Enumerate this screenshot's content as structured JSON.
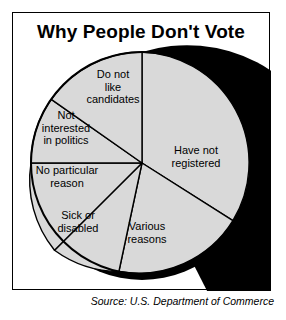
{
  "chart_title": "Why People Don't Vote",
  "source_note": "Source: U.S. Department of Commerce",
  "colors": {
    "slice_fill": "#d9d9d9",
    "outline": "#000000",
    "shadow": "#000000",
    "background": "#ffffff",
    "text": "#000000"
  },
  "labels": {
    "have_not_registered": "Have not\nregistered",
    "various_reasons": "Various\nreasons",
    "sick_or_disabled": "Sick or\ndisabled",
    "no_particular_reason": "No particular\nreason",
    "not_interested_in_politics": "Not\ninterested\nin politics",
    "do_not_like_candidates": "Do not\nlike\ncandidates"
  },
  "chart_data": {
    "type": "pie",
    "title": "Why People Don't Vote",
    "xlabel": "",
    "ylabel": "",
    "legend_position": "none",
    "grid": false,
    "labels_inside_slices": true,
    "start_angle_deg": 0,
    "direction": "clockwise",
    "categories": [
      "Have not registered",
      "Various reasons",
      "Sick or disabled",
      "No particular reason",
      "Not interested in politics",
      "Do not like candidates"
    ],
    "values": [
      34.7,
      18.6,
      11.1,
      10.6,
      9.7,
      15.3
    ],
    "units": "percent",
    "slices": [
      {
        "label": "Have not registered",
        "value": 34.7,
        "start_deg": 0,
        "end_deg": 125
      },
      {
        "label": "Various reasons",
        "value": 18.6,
        "start_deg": 125,
        "end_deg": 192
      },
      {
        "label": "Sick or disabled",
        "value": 11.1,
        "start_deg": 192,
        "end_deg": 232
      },
      {
        "label": "No particular reason",
        "value": 10.6,
        "start_deg": 232,
        "end_deg": 270
      },
      {
        "label": "Not interested in politics",
        "value": 9.7,
        "start_deg": 270,
        "end_deg": 305
      },
      {
        "label": "Do not like candidates",
        "value": 15.3,
        "start_deg": 305,
        "end_deg": 360
      }
    ]
  }
}
